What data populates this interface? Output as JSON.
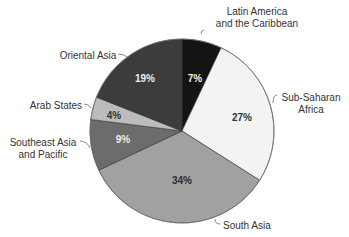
{
  "chart_data": {
    "type": "pie",
    "title": "",
    "start_angle_deg": 0,
    "direction": "clockwise",
    "center": [
      182,
      131
    ],
    "radius": 92,
    "slices": [
      {
        "label": "Latin America and the Caribbean",
        "label_lines": [
          "Latin America",
          "and the Caribbean"
        ],
        "value": 7,
        "pct_label": "7%",
        "color": "#141414",
        "text_color": "#f2f2f2",
        "pct_pos": [
          195,
          79
        ],
        "label_pos": [
          257,
          11
        ],
        "label_anchor": "middle",
        "leader": "M201,34 Q201,30 204,30"
      },
      {
        "label": "Sub-Saharan Africa",
        "label_lines": [
          "Sub-Saharan",
          "Africa"
        ],
        "value": 27,
        "pct_label": "27%",
        "color": "#f3f3f3",
        "text_color": "#333333",
        "pct_pos": [
          242,
          118
        ],
        "label_pos": [
          311,
          97
        ],
        "label_anchor": "middle",
        "leader": "M273,103 Q273,95 277,95"
      },
      {
        "label": "South Asia",
        "label_lines": [
          "South Asia"
        ],
        "value": 34,
        "pct_label": "34%",
        "color": "#a1a1a1",
        "text_color": "#2e2e2e",
        "pct_pos": [
          182,
          181
        ],
        "label_pos": [
          223,
          225
        ],
        "label_anchor": "start",
        "leader": "M215,219 Q215,224 220,224"
      },
      {
        "label": "Southeast Asia and Pacific",
        "label_lines": [
          "Southeast Asia",
          "and Pacific"
        ],
        "value": 9,
        "pct_label": "9%",
        "color": "#6c6c6c",
        "text_color": "#eeeeee",
        "pct_pos": [
          123,
          140
        ],
        "label_pos": [
          43,
          142
        ],
        "label_anchor": "middle",
        "leader": "M80,141 Q88,142 90,148"
      },
      {
        "label": "Arab States",
        "label_lines": [
          "Arab States"
        ],
        "value": 4,
        "pct_label": "4%",
        "color": "#bcbcbc",
        "text_color": "#333333",
        "pct_pos": [
          114,
          116
        ],
        "label_pos": [
          56,
          105
        ],
        "label_anchor": "middle",
        "leader": "M84,104 Q89,104 91,108"
      },
      {
        "label": "Oriental Asia",
        "label_lines": [
          "Oriental Asia"
        ],
        "value": 19,
        "pct_label": "19%",
        "color": "#3c3c3c",
        "text_color": "#eeeeee",
        "pct_pos": [
          145,
          79
        ],
        "label_pos": [
          88,
          55
        ],
        "label_anchor": "middle",
        "leader": "M118,54 Q124,54 127,57"
      }
    ]
  }
}
